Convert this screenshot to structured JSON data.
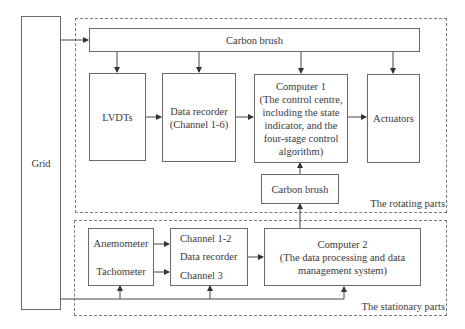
{
  "diagram": {
    "grid": "Grid",
    "rotating": {
      "region_label": "The rotating parts",
      "carbon_brush_top": "Carbon brush",
      "lvdts": "LVDTs",
      "data_recorder": [
        "Data recorder",
        "(Channel 1-6)"
      ],
      "computer1": [
        "Computer 1",
        "(The control centre,",
        "including the state",
        "indicator, and the",
        "four-stage control",
        "algorithm)"
      ],
      "actuators": "Actuators",
      "carbon_brush_mid": "Carbon brush"
    },
    "stationary": {
      "region_label": "The stationary parts",
      "anemometer": "Anemometer",
      "tachometer": "Tachometer",
      "channel_1_2": "Channel 1-2",
      "data_recorder": "Data recorder",
      "channel_3": "Channel 3",
      "computer2": [
        "Computer 2",
        "(The data processing and data",
        "management system)"
      ]
    }
  }
}
